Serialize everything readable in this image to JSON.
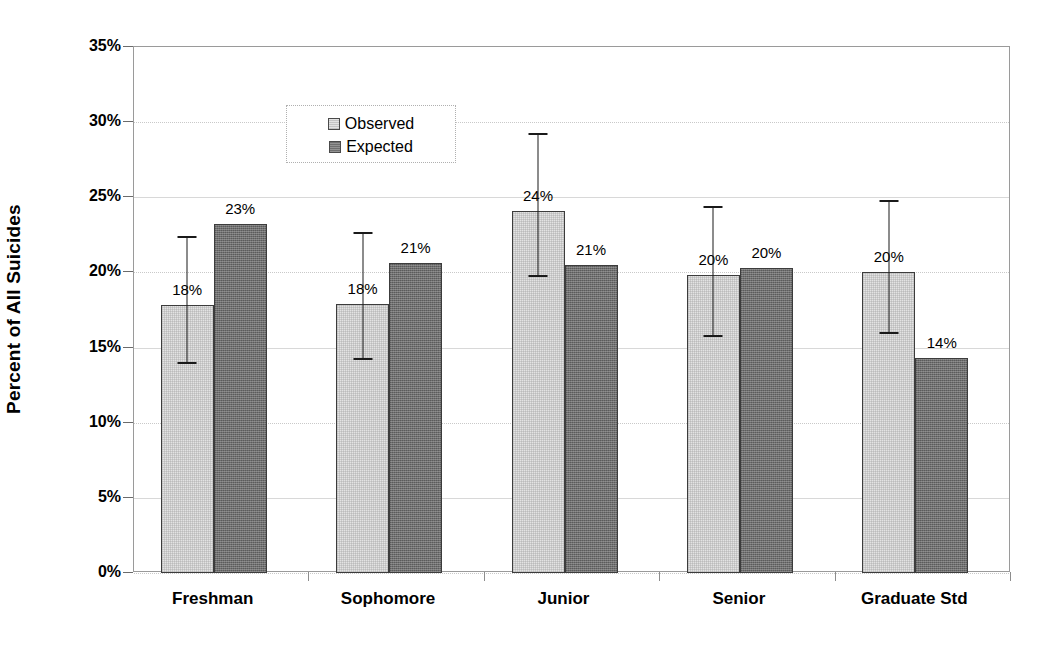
{
  "chart_data": {
    "type": "bar",
    "title": "",
    "xlabel": "",
    "ylabel": "Percent of All Suicides",
    "categories": [
      "Freshman",
      "Sophomore",
      "Junior",
      "Senior",
      "Graduate Std"
    ],
    "ylim": [
      0,
      35
    ],
    "ytick_labels": [
      "0%",
      "5%",
      "10%",
      "15%",
      "20%",
      "25%",
      "30%",
      "35%"
    ],
    "ytick_values": [
      0,
      5,
      10,
      15,
      20,
      25,
      30,
      35
    ],
    "grid": true,
    "legend_position": "upper-left-inside",
    "series": [
      {
        "name": "Observed",
        "color": "#e3e3e3",
        "values": [
          17.8,
          17.9,
          24.1,
          19.8,
          20.0
        ],
        "data_labels": [
          "18%",
          "18%",
          "24%",
          "20%",
          "20%"
        ],
        "error_bars": [
          {
            "low": 13.9,
            "high": 22.4
          },
          {
            "low": 14.2,
            "high": 22.7
          },
          {
            "low": 19.7,
            "high": 29.3
          },
          {
            "low": 15.7,
            "high": 24.4
          },
          {
            "low": 15.9,
            "high": 24.8
          }
        ]
      },
      {
        "name": "Expected",
        "color": "#6f6f6f",
        "values": [
          23.2,
          20.6,
          20.5,
          20.3,
          14.3
        ],
        "data_labels": [
          "23%",
          "21%",
          "21%",
          "20%",
          "14%"
        ],
        "error_bars": null
      }
    ]
  },
  "legend": {
    "items": [
      {
        "label": "Observed",
        "swatch": "observed"
      },
      {
        "label": "Expected",
        "swatch": "expected"
      }
    ]
  }
}
